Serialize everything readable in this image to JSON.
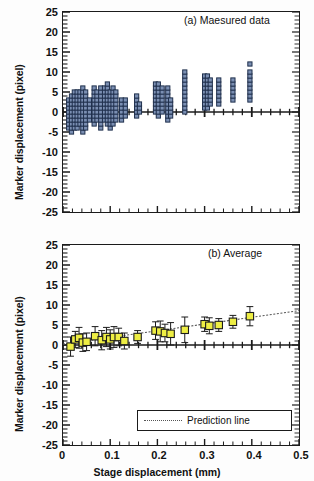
{
  "figure": {
    "axis_label_y": "Marker displacement (pixel)",
    "axis_label_x": "Stage displacement (mm)"
  },
  "panel_a": {
    "title": "(a) Maesured data"
  },
  "panel_b": {
    "title": "(b) Average",
    "legend_label": "Prediction line"
  },
  "colors": {
    "scatter_fill": "#7b8fb3",
    "scatter_edge": "#20304d",
    "average_fill": "#eeee44",
    "average_edge": "#1b1b1b",
    "axis": "#1b1b1b",
    "prediction_line": "#555555"
  },
  "chart_data": [
    {
      "type": "scatter",
      "title": "(a) Maesured data",
      "xlabel": "Stage displacement (mm)",
      "ylabel": "Marker displacement (pixel)",
      "xlim": [
        0,
        0.5
      ],
      "ylim": [
        -25,
        25
      ],
      "xticks": [
        "0",
        "0.1",
        "0.2",
        "0.3",
        "0.4",
        "0.5"
      ],
      "xtick_values": [
        0,
        0.1,
        0.2,
        0.3,
        0.4,
        0.5
      ],
      "yticks": [
        "25",
        "20",
        "15",
        "10",
        "5",
        "0",
        "-5",
        "-10",
        "-15",
        "-20",
        "-25"
      ],
      "ytick_values": [
        25,
        20,
        15,
        10,
        5,
        0,
        -5,
        -10,
        -15,
        -20,
        -25
      ],
      "grid": false,
      "legend": null,
      "marker": "square",
      "series": [
        {
          "name": "Measured data",
          "columns": [
            {
              "x": 0.012,
              "y": [
                -4,
                -3,
                -2,
                -1,
                0,
                1,
                2,
                3
              ]
            },
            {
              "x": 0.018,
              "y": [
                -5,
                -4,
                -3,
                -2,
                -1,
                0,
                1,
                2,
                3,
                4
              ]
            },
            {
              "x": 0.024,
              "y": [
                -4,
                -3,
                -2,
                -1,
                0,
                1,
                2,
                3,
                4,
                5
              ]
            },
            {
              "x": 0.03,
              "y": [
                -4,
                -3,
                -2,
                -1,
                0,
                1,
                2,
                3,
                4,
                5
              ]
            },
            {
              "x": 0.036,
              "y": [
                -3,
                -2,
                -1,
                0,
                1,
                2,
                3,
                4,
                5
              ]
            },
            {
              "x": 0.042,
              "y": [
                -5,
                -4,
                -3,
                -2,
                -1,
                0,
                1,
                2,
                3,
                4,
                5,
                6
              ]
            },
            {
              "x": 0.048,
              "y": [
                -4,
                -3,
                -2,
                -1,
                0,
                1,
                2,
                3,
                4,
                5
              ]
            },
            {
              "x": 0.056,
              "y": [
                -2,
                -1,
                0,
                1,
                2,
                3
              ]
            },
            {
              "x": 0.066,
              "y": [
                -3,
                -2,
                -1,
                0,
                1,
                2,
                3,
                4,
                5,
                6
              ]
            },
            {
              "x": 0.072,
              "y": [
                -2,
                -1,
                0,
                1,
                2,
                3,
                4,
                5
              ]
            },
            {
              "x": 0.08,
              "y": [
                -4,
                -3,
                -2,
                -1,
                0,
                1,
                2,
                3,
                4,
                5,
                6
              ]
            },
            {
              "x": 0.088,
              "y": [
                -2,
                -1,
                0,
                1,
                2,
                3,
                4,
                5,
                6
              ]
            },
            {
              "x": 0.094,
              "y": [
                -3,
                -2,
                -1,
                0,
                1,
                2,
                3,
                4,
                5,
                6,
                7
              ]
            },
            {
              "x": 0.1,
              "y": [
                -4,
                -3,
                -2,
                -1,
                0,
                1,
                2,
                3,
                4,
                5
              ]
            },
            {
              "x": 0.106,
              "y": [
                -3,
                -2,
                -1,
                0,
                1,
                2,
                3,
                4,
                5,
                6
              ]
            },
            {
              "x": 0.112,
              "y": [
                -2,
                -1,
                0,
                1,
                2,
                3,
                4,
                5
              ]
            },
            {
              "x": 0.124,
              "y": [
                -2,
                -1,
                0,
                1,
                2,
                3
              ]
            },
            {
              "x": 0.132,
              "y": [
                -1,
                0,
                1,
                2,
                3
              ]
            },
            {
              "x": 0.156,
              "y": [
                -1,
                0,
                1,
                2,
                3,
                4
              ]
            },
            {
              "x": 0.162,
              "y": [
                0,
                1,
                2
              ]
            },
            {
              "x": 0.196,
              "y": [
                0,
                1,
                2,
                3,
                4,
                5,
                6,
                7
              ]
            },
            {
              "x": 0.202,
              "y": [
                -1,
                0,
                1,
                2,
                3,
                4,
                5,
                6,
                7
              ]
            },
            {
              "x": 0.21,
              "y": [
                0,
                1,
                2,
                3,
                4,
                5,
                6
              ]
            },
            {
              "x": 0.222,
              "y": [
                -2,
                -1,
                0,
                1,
                2,
                3,
                4,
                5,
                6
              ]
            },
            {
              "x": 0.228,
              "y": [
                -1,
                0,
                1,
                2,
                3
              ]
            },
            {
              "x": 0.258,
              "y": [
                0,
                1,
                2,
                3,
                4,
                5,
                6,
                7,
                8,
                9,
                10
              ]
            },
            {
              "x": 0.3,
              "y": [
                1,
                2,
                3,
                4,
                5,
                6,
                7,
                8,
                9
              ]
            },
            {
              "x": 0.306,
              "y": [
                1,
                2,
                3,
                4,
                5,
                6,
                7,
                8,
                9
              ]
            },
            {
              "x": 0.312,
              "y": [
                2,
                3,
                4,
                5,
                6,
                7,
                8
              ]
            },
            {
              "x": 0.33,
              "y": [
                2,
                3,
                4,
                5,
                6,
                7,
                8
              ]
            },
            {
              "x": 0.36,
              "y": [
                3,
                4,
                5,
                6,
                7,
                8
              ]
            },
            {
              "x": 0.396,
              "y": [
                3,
                4,
                5,
                6,
                7,
                8,
                9,
                10,
                12
              ]
            }
          ]
        }
      ]
    },
    {
      "type": "scatter",
      "title": "(b) Average",
      "xlabel": "Stage displacement (mm)",
      "ylabel": "Marker displacement (pixel)",
      "xlim": [
        0,
        0.5
      ],
      "ylim": [
        -25,
        25
      ],
      "xticks": [
        "0",
        "0.1",
        "0.2",
        "0.3",
        "0.4",
        "0.5"
      ],
      "xtick_values": [
        0,
        0.1,
        0.2,
        0.3,
        0.4,
        0.5
      ],
      "yticks": [
        "25",
        "20",
        "15",
        "10",
        "5",
        "0",
        "-5",
        "-10",
        "-15",
        "-20",
        "-25"
      ],
      "ytick_values": [
        25,
        20,
        15,
        10,
        5,
        0,
        -5,
        -10,
        -15,
        -20,
        -25
      ],
      "grid": false,
      "legend": [
        "Prediction line"
      ],
      "legend_position": "bottom-right",
      "marker": "square",
      "series": [
        {
          "name": "Average",
          "x": [
            0.016,
            0.026,
            0.034,
            0.042,
            0.05,
            0.068,
            0.082,
            0.092,
            0.1,
            0.108,
            0.118,
            0.13,
            0.158,
            0.196,
            0.206,
            0.216,
            0.228,
            0.258,
            0.3,
            0.31,
            0.33,
            0.36,
            0.396
          ],
          "y": [
            -0.4,
            1.4,
            1.8,
            0.6,
            0.8,
            2.2,
            1.2,
            2.0,
            1.4,
            2.0,
            2.0,
            1.0,
            2.0,
            3.6,
            3.4,
            3.0,
            2.8,
            3.8,
            5.2,
            4.8,
            5.0,
            5.8,
            7.2
          ],
          "yerr": [
            2.4,
            2.0,
            2.6,
            2.2,
            2.2,
            2.4,
            2.4,
            2.4,
            2.4,
            2.6,
            2.2,
            2.0,
            1.6,
            2.2,
            2.6,
            2.2,
            2.8,
            3.2,
            1.8,
            2.0,
            1.6,
            1.6,
            2.4
          ]
        },
        {
          "name": "Prediction line",
          "style": "dotted",
          "x": [
            0.0,
            0.5
          ],
          "y": [
            0.2,
            8.6
          ]
        }
      ]
    }
  ]
}
